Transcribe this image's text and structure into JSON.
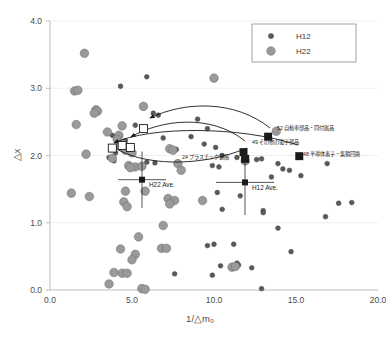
{
  "chart_data": {
    "type": "scatter",
    "title": "",
    "xlabel": "1/△m₀",
    "ylabel": "△x",
    "xlim": [
      0.0,
      20.0
    ],
    "ylim": [
      0.0,
      4.0
    ],
    "xticks": [
      "0.0",
      "5.0",
      "10.0",
      "15.0",
      "20.0"
    ],
    "yticks": [
      "0.0",
      "1.0",
      "2.0",
      "3.0",
      "4.0"
    ],
    "grid": "horizontal-light",
    "legend_position": "top-right",
    "series": [
      {
        "name": "H12",
        "marker": "small-circle",
        "color": "#595959",
        "points": [
          [
            5.9,
            3.17
          ],
          [
            4.3,
            3.03
          ],
          [
            6.3,
            2.63
          ],
          [
            6.6,
            2.6
          ],
          [
            9.0,
            2.54
          ],
          [
            5.2,
            2.45
          ],
          [
            3.8,
            2.3
          ],
          [
            8.6,
            2.28
          ],
          [
            6.9,
            2.26
          ],
          [
            9.6,
            2.4
          ],
          [
            9.4,
            2.17
          ],
          [
            7.3,
            2.12
          ],
          [
            10.1,
            2.12
          ],
          [
            7.4,
            2.1
          ],
          [
            4.6,
            2.08
          ],
          [
            7.5,
            2.07
          ],
          [
            4.0,
            2.04
          ],
          [
            10.5,
            2.0
          ],
          [
            11.4,
            1.97
          ],
          [
            12.6,
            1.94
          ],
          [
            3.9,
            1.92
          ],
          [
            5.9,
            1.9
          ],
          [
            6.4,
            1.89
          ],
          [
            13.9,
            1.88
          ],
          [
            9.9,
            1.85
          ],
          [
            10.3,
            1.83
          ],
          [
            12.9,
            1.95
          ],
          [
            14.2,
            1.8
          ],
          [
            14.6,
            1.78
          ],
          [
            16.9,
            1.88
          ],
          [
            15.3,
            1.7
          ],
          [
            13.5,
            1.68
          ],
          [
            10.2,
            1.45
          ],
          [
            11.6,
            1.4
          ],
          [
            17.6,
            1.29
          ],
          [
            18.4,
            1.3
          ],
          [
            16.8,
            1.09
          ],
          [
            13.0,
            1.18
          ],
          [
            13.0,
            1.15
          ],
          [
            10.5,
            1.2
          ],
          [
            13.9,
            0.92
          ],
          [
            10.0,
            0.68
          ],
          [
            11.2,
            0.68
          ],
          [
            9.6,
            0.66
          ],
          [
            14.7,
            0.57
          ],
          [
            11.4,
            0.4
          ],
          [
            11.5,
            0.37
          ],
          [
            10.4,
            0.36
          ],
          [
            12.3,
            0.33
          ],
          [
            9.9,
            0.22
          ],
          [
            7.6,
            0.24
          ],
          [
            12.9,
            0.02
          ],
          [
            4.6,
            2.22
          ],
          [
            4.5,
            2.18
          ],
          [
            4.2,
            2.14
          ],
          [
            3.6,
            1.97
          ],
          [
            7.6,
            2.08
          ],
          [
            7.7,
            2.09
          ]
        ]
      },
      {
        "name": "H22",
        "marker": "large-circle",
        "color": "#9a9a9a",
        "points": [
          [
            2.1,
            3.52
          ],
          [
            10.0,
            3.15
          ],
          [
            1.5,
            2.96
          ],
          [
            1.7,
            2.97
          ],
          [
            2.8,
            2.68
          ],
          [
            2.9,
            2.66
          ],
          [
            2.7,
            2.63
          ],
          [
            1.6,
            2.46
          ],
          [
            5.7,
            2.73
          ],
          [
            4.4,
            2.44
          ],
          [
            3.5,
            2.35
          ],
          [
            4.2,
            2.3
          ],
          [
            4.1,
            2.24
          ],
          [
            4.4,
            2.18
          ],
          [
            2.2,
            2.02
          ],
          [
            4.3,
            2.14
          ],
          [
            4.6,
            2.08
          ],
          [
            5.0,
            2.04
          ],
          [
            7.3,
            2.1
          ],
          [
            7.5,
            2.08
          ],
          [
            13.8,
            2.36
          ],
          [
            3.8,
            1.96
          ],
          [
            4.8,
            1.85
          ],
          [
            5.2,
            1.83
          ],
          [
            4.9,
            1.82
          ],
          [
            5.6,
            1.84
          ],
          [
            7.8,
            1.88
          ],
          [
            8.0,
            1.78
          ],
          [
            11.9,
            1.92
          ],
          [
            1.3,
            1.44
          ],
          [
            2.4,
            1.39
          ],
          [
            4.6,
            1.47
          ],
          [
            5.8,
            1.47
          ],
          [
            7.2,
            1.36
          ],
          [
            7.6,
            1.33
          ],
          [
            9.3,
            1.33
          ],
          [
            4.5,
            1.31
          ],
          [
            4.7,
            1.24
          ],
          [
            7.3,
            1.28
          ],
          [
            6.9,
            0.96
          ],
          [
            5.4,
            0.79
          ],
          [
            6.8,
            0.62
          ],
          [
            7.1,
            0.62
          ],
          [
            4.3,
            0.61
          ],
          [
            5.2,
            0.53
          ],
          [
            5.0,
            0.45
          ],
          [
            4.4,
            0.25
          ],
          [
            4.7,
            0.25
          ],
          [
            3.9,
            0.26
          ],
          [
            3.6,
            0.09
          ],
          [
            5.6,
            0.02
          ],
          [
            5.8,
            0.01
          ],
          [
            11.1,
            0.34
          ],
          [
            11.3,
            0.35
          ]
        ]
      }
    ],
    "highlight_points": [
      {
        "label": "52 自動車部品・同付属品",
        "x": 13.3,
        "y": 2.28,
        "marker": "filled-square"
      },
      {
        "label": "49 その他の電子部品",
        "x": 11.8,
        "y": 2.05,
        "marker": "filled-square"
      },
      {
        "label": "48 半導体素子・集積回路",
        "x": 15.2,
        "y": 1.99,
        "marker": "filled-square"
      },
      {
        "label": "24 プラスチック製品",
        "x": 11.9,
        "y": 1.95,
        "marker": "filled-square"
      }
    ],
    "origin_points": [
      {
        "x": 5.7,
        "y": 2.4,
        "marker": "open-square"
      },
      {
        "x": 4.4,
        "y": 2.15,
        "marker": "open-square"
      },
      {
        "x": 3.8,
        "y": 2.11,
        "marker": "open-square"
      },
      {
        "x": 4.9,
        "y": 2.12,
        "marker": "open-square"
      }
    ],
    "average_markers": [
      {
        "label": "H22 Ave.",
        "x": 5.6,
        "y": 1.64,
        "xerr": 1.5,
        "yerr": 0.42
      },
      {
        "label": "H12 Ave.",
        "x": 11.6,
        "y": 1.6,
        "xerr": 1.8,
        "yerr": 0.48
      }
    ]
  },
  "legend": {
    "entries": [
      {
        "label": "H12",
        "marker": "small-circle"
      },
      {
        "label": "H22",
        "marker": "large-circle"
      }
    ]
  },
  "colors": {
    "h12_marker": "#595959",
    "h22_marker": "#9a9a9a",
    "axis": "#bdbdbd",
    "text": "#4a4a4a",
    "arrow": "#1a1a1a"
  }
}
